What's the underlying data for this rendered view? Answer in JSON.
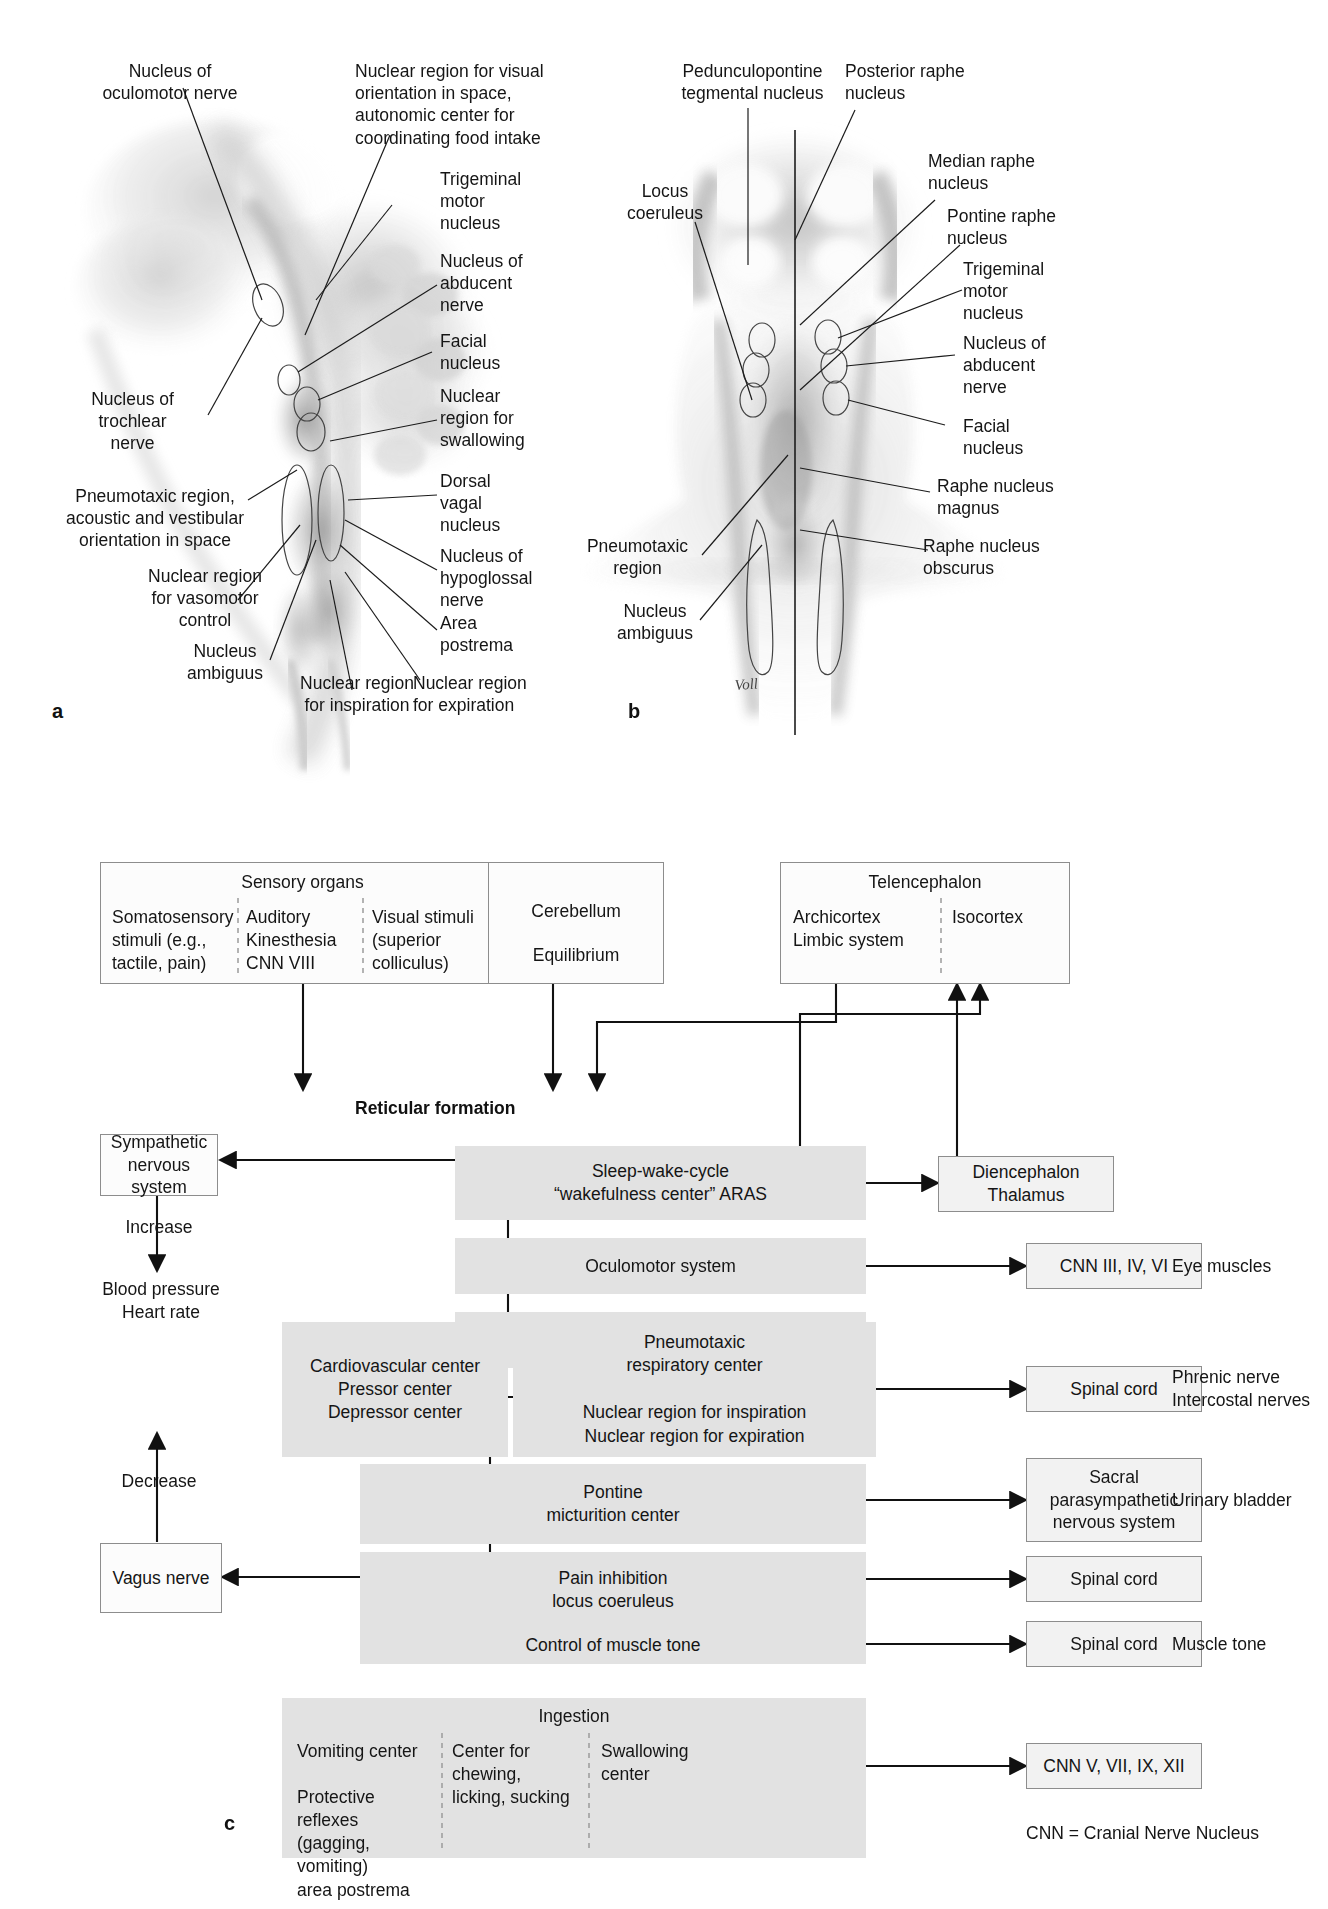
{
  "figure": {
    "panel_a_letter": "a",
    "panel_b_letter": "b",
    "panel_c_letter": "c"
  },
  "panel_a": {
    "labels": [
      {
        "id": "nucleus-oculomotor-nerve",
        "text": "Nucleus of\noculomotor nerve"
      },
      {
        "id": "nuclear-region-visual-orientation",
        "text": "Nuclear region for visual\norientation in space,\nautonomic center for\ncoordinating food intake"
      },
      {
        "id": "trigeminal-motor-nucleus",
        "text": "Trigeminal\nmotor\nnucleus"
      },
      {
        "id": "nucleus-abducent-nerve",
        "text": "Nucleus of\nabducent\nnerve"
      },
      {
        "id": "facial-nucleus",
        "text": "Facial\nnucleus"
      },
      {
        "id": "nuclear-region-swallowing",
        "text": "Nuclear\nregion for\nswallowing"
      },
      {
        "id": "dorsal-vagal-nucleus",
        "text": "Dorsal\nvagal\nnucleus"
      },
      {
        "id": "nucleus-hypoglossal-nerve",
        "text": "Nucleus of\nhypoglossal\nnerve"
      },
      {
        "id": "area-postrema",
        "text": "Area\npostrema"
      },
      {
        "id": "nuclear-region-expiration",
        "text": "Nuclear region\nfor expiration"
      },
      {
        "id": "nuclear-region-inspiration",
        "text": "Nuclear region\nfor inspiration"
      },
      {
        "id": "nucleus-ambiguus",
        "text": "Nucleus\nambiguus"
      },
      {
        "id": "nuclear-region-vasomotor-control",
        "text": "Nuclear region\nfor vasomotor\ncontrol"
      },
      {
        "id": "pneumotaxic-region-acoustic-vestibular",
        "text": "Pneumotaxic region,\nacoustic and vestibular\norientation in space"
      },
      {
        "id": "nucleus-trochlear-nerve",
        "text": "Nucleus of\ntrochlear\nnerve"
      }
    ]
  },
  "panel_b": {
    "labels": [
      {
        "id": "pedunculopontine-tegmental-nucleus",
        "text": "Pedunculopontine\ntegmental nucleus"
      },
      {
        "id": "posterior-raphe-nucleus",
        "text": "Posterior raphe\nnucleus"
      },
      {
        "id": "median-raphe-nucleus",
        "text": "Median raphe\nnucleus"
      },
      {
        "id": "pontine-raphe-nucleus",
        "text": "Pontine raphe\nnucleus"
      },
      {
        "id": "trigeminal-motor-nucleus-b",
        "text": "Trigeminal\nmotor\nnucleus"
      },
      {
        "id": "nucleus-abducent-nerve-b",
        "text": "Nucleus of\nabducent\nnerve"
      },
      {
        "id": "facial-nucleus-b",
        "text": "Facial\nnucleus"
      },
      {
        "id": "raphe-nucleus-magnus",
        "text": "Raphe nucleus\nmagnus"
      },
      {
        "id": "raphe-nucleus-obscurus",
        "text": "Raphe nucleus\nobscurus"
      },
      {
        "id": "locus-coeruleus",
        "text": "Locus\ncoeruleus"
      },
      {
        "id": "pneumotaxic-region-b",
        "text": "Pneumotaxic\nregion"
      },
      {
        "id": "nucleus-ambiguus-b",
        "text": "Nucleus\nambiguus"
      }
    ],
    "signature": "Voll"
  },
  "panel_c": {
    "inputs": {
      "sensory_organs": {
        "title": "Sensory organs",
        "columns": [
          "Somatosensory\nstimuli (e.g.,\ntactile, pain)",
          "Auditory\nKinesthesia\nCNN VIII",
          "Visual stimuli\n(superior colliculus)"
        ]
      },
      "cerebellum": {
        "lines": [
          "Cerebellum",
          "Equilibrium"
        ]
      },
      "telencephalon": {
        "title": "Telencephalon",
        "columns": [
          "Archicortex\nLimbic system",
          "Isocortex"
        ]
      }
    },
    "reticular_formation_heading": "Reticular formation",
    "functions": [
      {
        "id": "sleep-wake-cycle",
        "text": "Sleep-wake-cycle\n“wakefulness center” ARAS"
      },
      {
        "id": "oculomotor-system",
        "text": "Oculomotor system"
      },
      {
        "id": "spatial-orientation",
        "text": "Spatial orientation"
      },
      {
        "id": "cardiovascular-center",
        "text": "Cardiovascular center\nPressor center\nDepressor center"
      },
      {
        "id": "pneumotaxic-respiratory-center",
        "text": "Pneumotaxic\nrespiratory center\n\nNuclear region for inspiration\nNuclear region for expiration"
      },
      {
        "id": "pontine-micturition-center",
        "text": "Pontine\nmicturition center"
      },
      {
        "id": "pain-inhibition-locus-coeruleus",
        "text": "Pain inhibition\nlocus coeruleus"
      },
      {
        "id": "control-of-muscle-tone",
        "text": "Control of muscle tone"
      }
    ],
    "ingestion": {
      "title": "Ingestion",
      "columns": [
        "Vomiting center\n\nProtective reflexes\n(gagging, vomiting)\narea postrema",
        "Center for\nchewing,\nlicking, sucking",
        "Swallowing\ncenter"
      ]
    },
    "targets": [
      {
        "id": "diencephalon-thalamus",
        "text": "Diencephalon\nThalamus"
      },
      {
        "id": "cnn-3-4-6",
        "text": "CNN III, IV, VI"
      },
      {
        "id": "spinal-cord-respiratory",
        "text": "Spinal cord"
      },
      {
        "id": "sacral-parasympathetic",
        "text": "Sacral\nparasympathetic\nnervous system"
      },
      {
        "id": "spinal-cord-pain",
        "text": "Spinal cord"
      },
      {
        "id": "spinal-cord-muscle-tone",
        "text": "Spinal cord"
      },
      {
        "id": "cnn-5-7-9-12",
        "text": "CNN V, VII, IX, XII"
      }
    ],
    "effectors": [
      {
        "id": "eye-muscles",
        "text": "Eye muscles"
      },
      {
        "id": "phrenic-intercostal-nerves",
        "text": "Phrenic nerve\nIntercostal nerves"
      },
      {
        "id": "urinary-bladder",
        "text": "Urinary bladder"
      },
      {
        "id": "muscle-tone",
        "text": "Muscle tone"
      }
    ],
    "autonomic_loop": {
      "sympathetic": "Sympathetic\nnervous system",
      "increase": "Increase",
      "blood_pressure": "Blood pressure\nHeart rate",
      "decrease": "Decrease",
      "vagus": "Vagus nerve"
    },
    "footnote": "CNN = Cranial Nerve Nucleus"
  },
  "colors": {
    "box_fill": "#f2f2f2",
    "gray_fill": "#e2e2e2",
    "border": "#8d8d8d",
    "line": "#111111",
    "text": "#151515"
  }
}
